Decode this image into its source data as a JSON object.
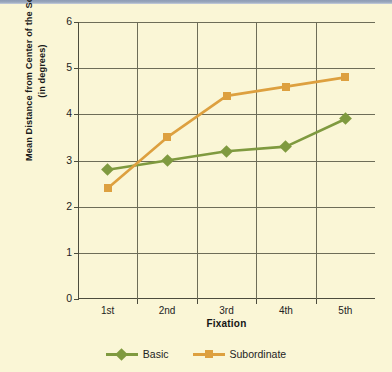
{
  "chart_data": {
    "type": "line",
    "title": "",
    "xlabel": "Fixation",
    "ylabel": "Mean Distance from Center of the Scene (in degrees)",
    "ylabel_line1": "Mean Distance from Center of the Scene",
    "ylabel_line2": "(in degrees)",
    "categories": [
      "1st",
      "2nd",
      "3rd",
      "4th",
      "5th"
    ],
    "ylim": [
      0,
      6
    ],
    "yticks": [
      0,
      1,
      2,
      3,
      4,
      5,
      6
    ],
    "ytick_labels": [
      "0",
      "1",
      "2",
      "3",
      "4",
      "5",
      "6"
    ],
    "grid": true,
    "legend_position": "bottom",
    "series": [
      {
        "name": "Basic",
        "color": "#7f9a3f",
        "marker": "diamond",
        "values": [
          2.8,
          3.0,
          3.2,
          3.3,
          3.9
        ]
      },
      {
        "name": "Subordinate",
        "color": "#dda03f",
        "marker": "square",
        "values": [
          2.4,
          3.5,
          4.4,
          4.6,
          4.8
        ]
      }
    ]
  },
  "colors": {
    "background": "#faf6d6",
    "axis": "#4c4c3d",
    "gridline": "#6d6d58",
    "topbar": "#8e9cb4",
    "series_basic": "#7f9a3f",
    "series_subordinate": "#dda03f"
  }
}
